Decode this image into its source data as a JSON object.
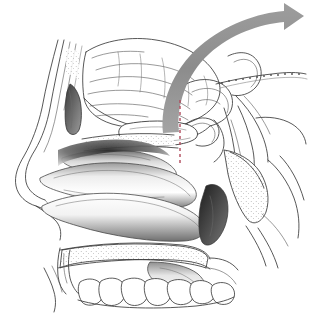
{
  "figure": {
    "background_color": "#ffffff",
    "width": 309,
    "height": 319,
    "style": "grayscale pen-and-ink medical illustration with airbrush shading"
  },
  "annotations": {
    "airflow_arrow": {
      "name": "curved-airflow-arrow",
      "color": "#8f8f8f",
      "description": "Thick gray curved arrow sweeping from the sphenoid region up and over to the right",
      "start_x": 163,
      "start_y": 133,
      "end_x": 300,
      "end_y": 13,
      "head_direction": "right"
    },
    "reference_line": {
      "name": "red-dashed-reference-line",
      "color": "#b04a5c",
      "description": "Vertical red dashed line marking the surgical corridor through the sphenoid sinus",
      "x": 180,
      "y_top": 100,
      "y_bottom": 166,
      "dash": "3 3"
    }
  },
  "structures": [
    {
      "id": "frontal-sinus",
      "label": "Frontal sinus",
      "shading": "dark"
    },
    {
      "id": "nasal-bone",
      "label": "Nasal bone",
      "shading": "outline"
    },
    {
      "id": "cerebrum",
      "label": "Cerebrum / frontal lobe",
      "shading": "line-gyri"
    },
    {
      "id": "corpus-callosum",
      "label": "Corpus callosum",
      "shading": "outline"
    },
    {
      "id": "sphenoid-sinus",
      "label": "Sphenoid sinus",
      "shading": "light"
    },
    {
      "id": "pituitary-fossa",
      "label": "Pituitary fossa / sella turcica",
      "shading": "outline"
    },
    {
      "id": "superior-turbinate",
      "label": "Superior turbinate",
      "shading": "gradient"
    },
    {
      "id": "middle-turbinate",
      "label": "Middle turbinate",
      "shading": "gradient"
    },
    {
      "id": "inferior-turbinate",
      "label": "Inferior turbinate",
      "shading": "gradient"
    },
    {
      "id": "hard-palate",
      "label": "Hard palate",
      "shading": "stippled"
    },
    {
      "id": "soft-palate",
      "label": "Soft palate",
      "shading": "gradient"
    },
    {
      "id": "maxillary-teeth",
      "label": "Maxillary teeth",
      "count": 7
    },
    {
      "id": "clivus",
      "label": "Clivus",
      "shading": "stippled"
    },
    {
      "id": "nasopharynx",
      "label": "Nasopharynx",
      "shading": "dark"
    },
    {
      "id": "cerebellum",
      "label": "Cerebellum / tentorium",
      "shading": "outline"
    },
    {
      "id": "brainstem",
      "label": "Brainstem",
      "shading": "outline"
    },
    {
      "id": "cervical-vertebra",
      "label": "Cervical vertebra",
      "shading": "outline"
    }
  ],
  "caption": {
    "text": "",
    "visible": false
  }
}
